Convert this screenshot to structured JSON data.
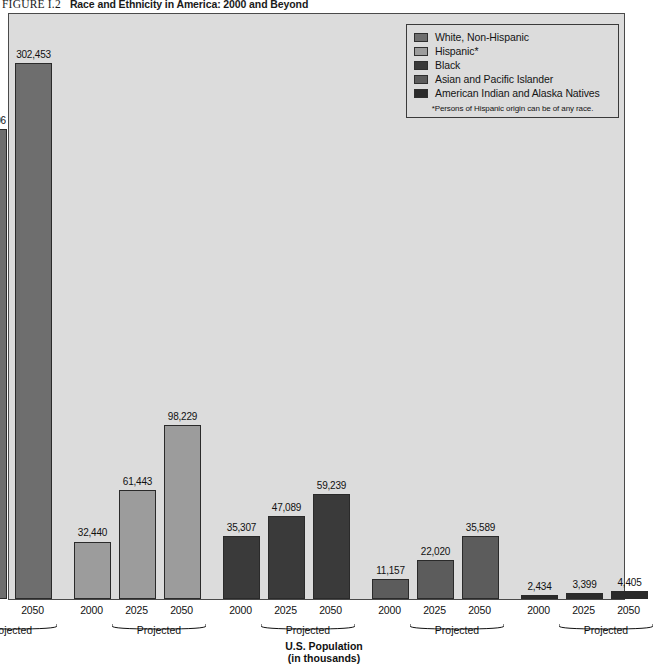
{
  "figure": {
    "number": "FIGURE I.2",
    "title": "Race and Ethnicity in America: 2000 and Beyond"
  },
  "legend": {
    "items": [
      {
        "label": "White, Non-Hispanic",
        "color": "#6e6e6e"
      },
      {
        "label": "Hispanic*",
        "color": "#9c9c9c"
      },
      {
        "label": "Black",
        "color": "#3a3a3a"
      },
      {
        "label": "Asian and Pacific Islander",
        "color": "#5c5c5c"
      },
      {
        "label": "American Indian and Alaska Natives",
        "color": "#2b2b2b"
      }
    ],
    "footnote": "*Persons of Hispanic origin can be of any race."
  },
  "axis": {
    "title_line1": "U.S. Population",
    "title_line2": "(in thousands)",
    "projected_label": "Projected",
    "tick_labels": [
      "2000",
      "2025",
      "2050"
    ]
  },
  "colors": {
    "plot_background": "#dcdcdc",
    "plot_border": "#4a4a4a",
    "page_background": "#ffffff",
    "text": "#111111"
  },
  "chart_data": {
    "type": "bar",
    "title": "Race and Ethnicity in America: 2000 and Beyond",
    "xlabel": "U.S. Population (in thousands)",
    "ylabel": "",
    "ylim": [
      0,
      330000
    ],
    "grid": false,
    "legend_position": "top-right",
    "categories": [
      "2000",
      "2025",
      "2050"
    ],
    "group_note": "2025 and 2050 are Projected",
    "series": [
      {
        "name": "White, Non-Hispanic",
        "color": "#6e6e6e",
        "values": [
          226232,
          265306,
          302453
        ],
        "labels": [
          "226,232",
          "265,306",
          "302,453"
        ]
      },
      {
        "name": "Hispanic*",
        "color": "#9c9c9c",
        "values": [
          32440,
          61443,
          98229
        ],
        "labels": [
          "32,440",
          "61,443",
          "98,229"
        ]
      },
      {
        "name": "Black",
        "color": "#3a3a3a",
        "values": [
          35307,
          47089,
          59239
        ],
        "labels": [
          "35,307",
          "47,089",
          "59,239"
        ]
      },
      {
        "name": "Asian and Pacific Islander",
        "color": "#5c5c5c",
        "values": [
          11157,
          22020,
          35589
        ],
        "labels": [
          "11,157",
          "22,020",
          "35,589"
        ]
      },
      {
        "name": "American Indian and Alaska Natives",
        "color": "#2b2b2b",
        "values": [
          2434,
          3399,
          4405
        ],
        "labels": [
          "2,434",
          "3,399",
          "4,405"
        ]
      }
    ]
  }
}
